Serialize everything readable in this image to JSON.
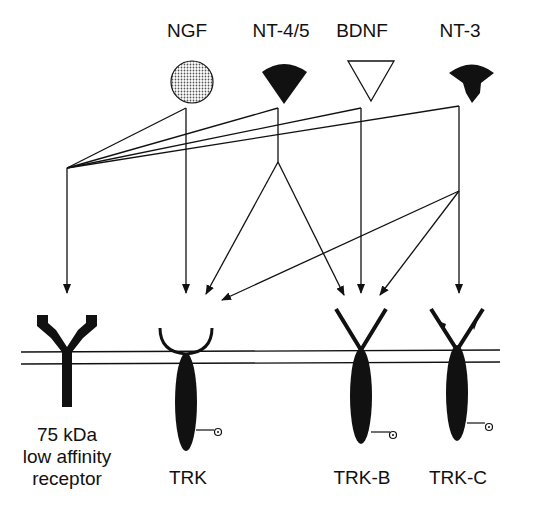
{
  "neurotrophins": [
    {
      "name": "NGF",
      "shape": "dotted-circle"
    },
    {
      "name": "NT-4/5",
      "shape": "filled-fan"
    },
    {
      "name": "BDNF",
      "shape": "open-triangle"
    },
    {
      "name": "NT-3",
      "shape": "filled-bell"
    }
  ],
  "receptors": [
    {
      "line1": "75 kDa",
      "line2": "low affinity",
      "line3": "receptor"
    },
    {
      "line1": "TRK"
    },
    {
      "line1": "TRK-B"
    },
    {
      "line1": "TRK-C"
    }
  ],
  "colors": {
    "ink": "#111111",
    "background": "#ffffff",
    "dots": "#d8d8d8"
  }
}
